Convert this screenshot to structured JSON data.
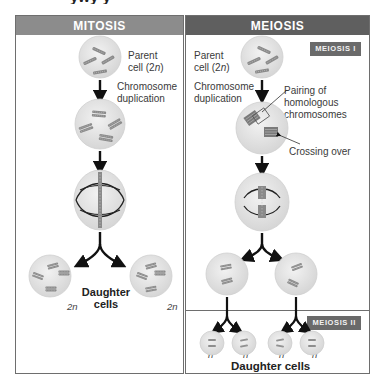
{
  "cropped_title_fragment": "ywy y",
  "mitosis": {
    "header": "MITOSIS",
    "labels": {
      "parent_cell_line1": "Parent",
      "parent_cell_line2_prefix": "cell (2",
      "parent_cell_line2_n": "n",
      "parent_cell_line2_suffix": ")",
      "duplication_line1": "Chromosome",
      "duplication_line2": "duplication",
      "daughter_line1": "Daughter",
      "daughter_line2": "cells",
      "ploidy_left": "2n",
      "ploidy_right": "2n"
    }
  },
  "meiosis": {
    "header": "MEIOSIS",
    "stage1_tag": "MEIOSIS I",
    "stage2_tag": "MEIOSIS II",
    "labels": {
      "parent_cell_line1": "Parent",
      "parent_cell_line2_prefix": "cell (2",
      "parent_cell_line2_n": "n",
      "parent_cell_line2_suffix": ")",
      "duplication_line1": "Chromosome",
      "duplication_line2": "duplication",
      "pairing_line1": "Pairing of",
      "pairing_line2": "homologous",
      "pairing_line3": "chromosomes",
      "crossing_over": "Crossing over",
      "daughter_cells": "Daughter cells",
      "ploidy": [
        "n",
        "n",
        "n",
        "n"
      ]
    }
  },
  "colors": {
    "mitosis_header": "#8c8c8c",
    "meiosis_header": "#5f5f5f",
    "stage_tag": "#6a6a6a",
    "cell_fill": "#e4e4e4",
    "chromosome": "#8a8a8a",
    "arrow": "#111111"
  }
}
